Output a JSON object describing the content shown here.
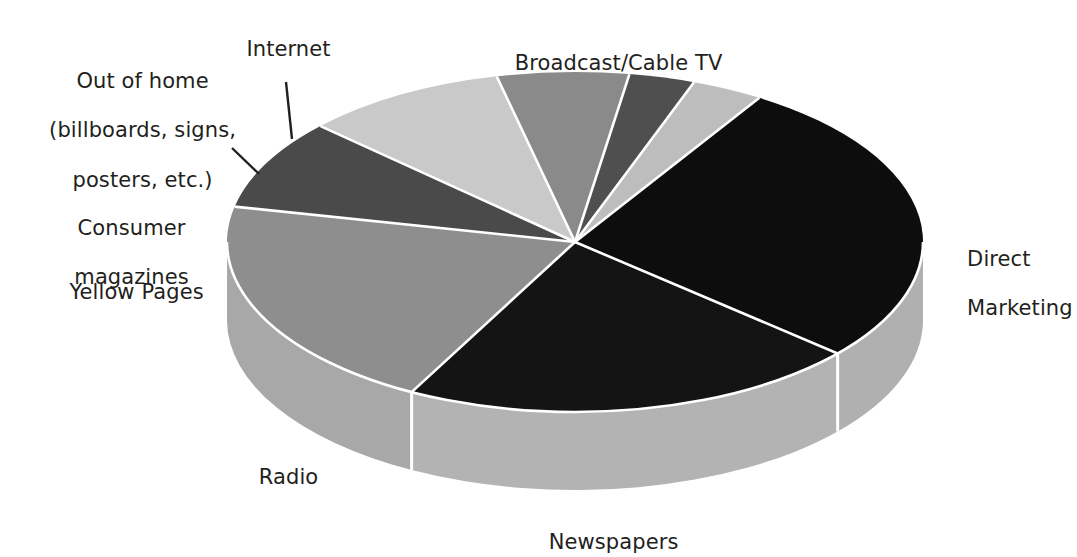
{
  "chart_data": {
    "type": "pie",
    "title": "",
    "subtitle": "",
    "xlabel": "",
    "ylabel": "",
    "legend_position": "callout-labels",
    "grid": false,
    "three_d": true,
    "categories": [
      "Broadcast/Cable TV",
      "Direct Marketing",
      "Newspapers",
      "Radio",
      "Yellow Pages",
      "Consumer magazines",
      "Out of home (billboards, signs, posters, etc.)",
      "Internet"
    ],
    "values": [
      27.5,
      21.5,
      20.5,
      8.5,
      9.5,
      6.0,
      3.0,
      3.5
    ],
    "units": "percent of total",
    "slices": [
      {
        "label": "Broadcast/Cable TV",
        "value": 27.5,
        "color": "#0d0d0d",
        "side_color": "#b0b0b0",
        "start_angle": -58,
        "end_angle": 41
      },
      {
        "label": "Direct Marketing",
        "value": 21.5,
        "color": "#141414",
        "side_color": "#b3b3b3",
        "start_angle": 41,
        "end_angle": 118
      },
      {
        "label": "Newspapers",
        "value": 20.5,
        "color": "#8e8e8e",
        "side_color": "#a8a8a8",
        "start_angle": 118,
        "end_angle": 192
      },
      {
        "label": "Radio",
        "value": 8.5,
        "color": "#4a4a4a",
        "side_color": "#b0b0b0",
        "start_angle": 192,
        "end_angle": 223
      },
      {
        "label": "Yellow Pages",
        "value": 9.5,
        "color": "#c9c9c9",
        "side_color": "#b5b5b5",
        "start_angle": 223,
        "end_angle": 257
      },
      {
        "label": "Consumer magazines",
        "value": 6.0,
        "color": "#8a8a8a",
        "side_color": "#a8a8a8",
        "start_angle": 257,
        "end_angle": 279
      },
      {
        "label": "Out of home (billboards, signs, posters, etc.)",
        "value": 3.0,
        "color": "#4f4f4f",
        "side_color": "#a8a8a8",
        "start_angle": 279,
        "end_angle": 290
      },
      {
        "label": "Internet",
        "value": 3.5,
        "color": "#bdbdbd",
        "side_color": "#b0b0b0",
        "start_angle": 290,
        "end_angle": 302
      }
    ]
  },
  "labels": {
    "broadcast_cable_tv": "Broadcast/Cable TV",
    "direct_marketing_line1": "Direct",
    "direct_marketing_line2": "Marketing",
    "newspapers": "Newspapers",
    "radio": "Radio",
    "yellow_pages": "Yellow Pages",
    "consumer_magazines_line1": "Consumer",
    "consumer_magazines_line2": "magazines",
    "out_of_home_line1": "Out of home",
    "out_of_home_line2": "(billboards, signs,",
    "out_of_home_line3": "posters, etc.)",
    "internet": "Internet"
  },
  "colors": {
    "background": "#ffffff",
    "text": "#231f20",
    "separator": "#ffffff",
    "leader_line": "#231f20",
    "broadcast_cable_tv": "#0d0d0d",
    "direct_marketing": "#141414",
    "newspapers": "#8e8e8e",
    "radio": "#4a4a4a",
    "yellow_pages": "#c9c9c9",
    "consumer_magazines": "#8a8a8a",
    "out_of_home": "#4f4f4f",
    "internet": "#bdbdbd",
    "pie_side_wall": "#b0b0b0"
  },
  "geometry": {
    "center_x": 575,
    "center_y": 242,
    "radius_x": 348,
    "radius_y": 170,
    "depth": 78
  }
}
